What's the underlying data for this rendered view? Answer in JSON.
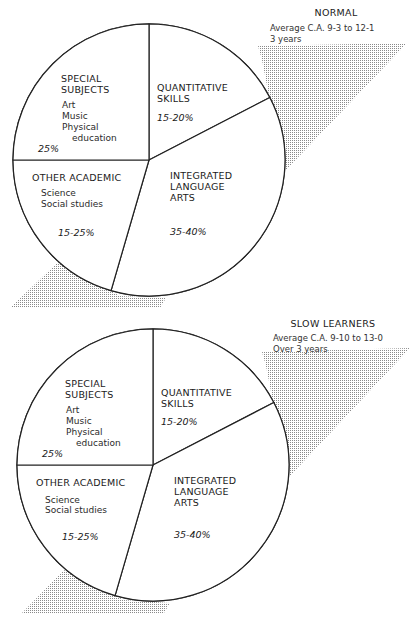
{
  "chart_data": [
    {
      "type": "pie",
      "title": "NORMAL",
      "subtitle_lines": [
        "Average C.A. 9-3 to 12-1",
        "3 years"
      ],
      "slices": [
        {
          "name": "QUANTITATIVE SKILLS",
          "label_lines": [
            "QUANTITATIVE",
            "SKILLS"
          ],
          "details": [],
          "range": "15-20%",
          "value": 17.4
        },
        {
          "name": "INTEGRATED LANGUAGE ARTS",
          "label_lines": [
            "INTEGRATED",
            "LANGUAGE",
            "ARTS"
          ],
          "details": [],
          "range": "35-40%",
          "value": 37.1
        },
        {
          "name": "OTHER ACADEMIC",
          "label_lines": [
            "OTHER ACADEMIC"
          ],
          "details": [
            "Science",
            "Social studies"
          ],
          "range": "15-25%",
          "value": 20.5
        },
        {
          "name": "SPECIAL SUBJECTS",
          "label_lines": [
            "SPECIAL",
            "SUBJECTS"
          ],
          "details": [
            "Art",
            "Music",
            "Physical",
            "education"
          ],
          "range": "25%",
          "value": 25.0
        }
      ]
    },
    {
      "type": "pie",
      "title": "SLOW LEARNERS",
      "subtitle_lines": [
        "Average C.A. 9-10 to 13-0",
        "Over 3 years"
      ],
      "slices": [
        {
          "name": "QUANTITATIVE SKILLS",
          "label_lines": [
            "QUANTITATIVE",
            "SKILLS"
          ],
          "details": [],
          "range": "15-20%",
          "value": 17.4
        },
        {
          "name": "INTEGRATED LANGUAGE ARTS",
          "label_lines": [
            "INTEGRATED",
            "LANGUAGE",
            "ARTS"
          ],
          "details": [],
          "range": "35-40%",
          "value": 37.1
        },
        {
          "name": "OTHER ACADEMIC",
          "label_lines": [
            "OTHER ACADEMIC"
          ],
          "details": [
            "Science",
            "Social studies"
          ],
          "range": "15-25%",
          "value": 20.5
        },
        {
          "name": "SPECIAL SUBJECTS",
          "label_lines": [
            "SPECIAL",
            "SUBJECTS"
          ],
          "details": [
            "Art",
            "Music",
            "Physical",
            "education"
          ],
          "range": "25%",
          "value": 25.0
        }
      ]
    }
  ],
  "colors": {
    "line": "#222222",
    "shading_dot": "#8a8a8a",
    "background": "#ffffff"
  }
}
